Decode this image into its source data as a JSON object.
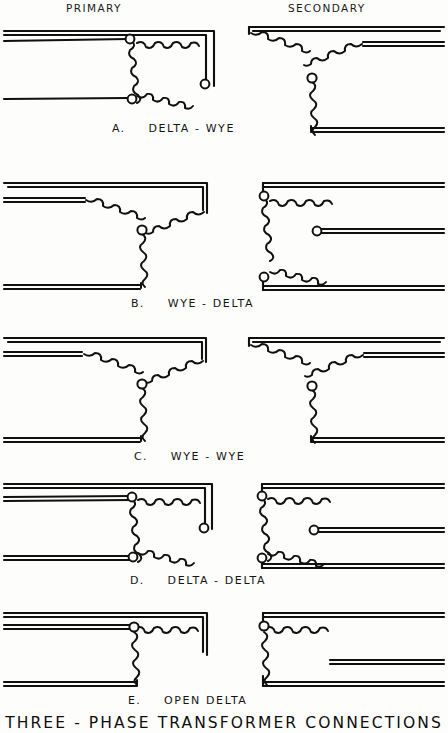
{
  "sheet": {
    "title": "THREE - PHASE TRANSFORMER CONNECTIONS",
    "column_headers": {
      "primary": "PRIMARY",
      "secondary": "SECONDARY"
    },
    "ink_color": "#101010",
    "background_color": "#fdfdfb",
    "node_fill": "#ffffff"
  },
  "rows": [
    {
      "index": "A.",
      "label": "DELTA - WYE",
      "primary_winding": "delta",
      "secondary_winding": "wye",
      "primary_phases": 3,
      "secondary_phases": 3,
      "primary_nodes": 3,
      "secondary_nodes": 1
    },
    {
      "index": "B.",
      "label": "WYE - DELTA",
      "primary_winding": "wye",
      "secondary_winding": "delta",
      "primary_phases": 3,
      "secondary_phases": 3,
      "primary_nodes": 1,
      "secondary_nodes": 3
    },
    {
      "index": "C.",
      "label": "WYE - WYE",
      "primary_winding": "wye",
      "secondary_winding": "wye",
      "primary_phases": 3,
      "secondary_phases": 3,
      "primary_nodes": 1,
      "secondary_nodes": 1
    },
    {
      "index": "D.",
      "label": "DELTA - DELTA",
      "primary_winding": "delta",
      "secondary_winding": "delta",
      "primary_phases": 3,
      "secondary_phases": 3,
      "primary_nodes": 3,
      "secondary_nodes": 3
    },
    {
      "index": "E.",
      "label": "OPEN DELTA",
      "primary_winding": "open-delta",
      "secondary_winding": "open-delta",
      "primary_phases": 2,
      "secondary_phases": 2,
      "primary_nodes": 1,
      "secondary_nodes": 1
    }
  ]
}
